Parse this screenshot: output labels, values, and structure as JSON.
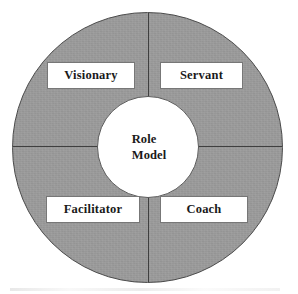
{
  "diagram": {
    "type": "donut-quadrant",
    "shape_name": "leadership-roles-wheel",
    "center": {
      "line1": "Role",
      "line2": "Model"
    },
    "quadrants": [
      {
        "id": "top-left",
        "label": "Visionary"
      },
      {
        "id": "top-right",
        "label": "Servant"
      },
      {
        "id": "bottom-left",
        "label": "Facilitator"
      },
      {
        "id": "bottom-right",
        "label": "Coach"
      }
    ],
    "colors": {
      "ring_fill": "#9b9b9b",
      "ring_border": "#4a4a4a",
      "hub_fill": "#ffffff",
      "hub_border": "#5a5a5a",
      "divider": "#3f3f3f",
      "label_box_fill": "#ffffff",
      "label_box_border": "#777777",
      "text": "#1a1a1a",
      "page_background": "#ffffff"
    }
  }
}
